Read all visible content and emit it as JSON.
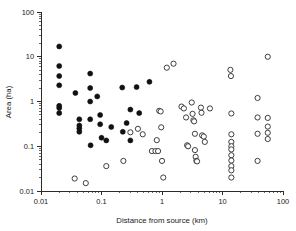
{
  "chart_data": {
    "type": "scatter",
    "title": "",
    "xlabel": "Distance from source (km)",
    "ylabel": "Area (ha)",
    "xscale": "log",
    "yscale": "log",
    "xlim": [
      0.01,
      100
    ],
    "ylim": [
      0.01,
      100
    ],
    "xticks": [
      "0.01",
      "0.1",
      "1",
      "10",
      "100"
    ],
    "xtick_values": [
      0.01,
      0.1,
      1,
      10,
      100
    ],
    "yticks": [
      "0.01",
      "0.1",
      "1",
      "10",
      "100"
    ],
    "ytick_values": [
      0.01,
      0.1,
      1,
      10,
      100
    ],
    "grid": false,
    "legend": null,
    "series": [
      {
        "name": "filled-circles",
        "marker": "filled circle",
        "color": "#111111",
        "points": [
          [
            0.02,
            17.0
          ],
          [
            0.02,
            6.2
          ],
          [
            0.02,
            3.7
          ],
          [
            0.02,
            2.3
          ],
          [
            0.02,
            0.8
          ],
          [
            0.02,
            0.72
          ],
          [
            0.02,
            0.55
          ],
          [
            0.037,
            1.55
          ],
          [
            0.043,
            0.4
          ],
          [
            0.043,
            0.29
          ],
          [
            0.043,
            0.25
          ],
          [
            0.043,
            0.21
          ],
          [
            0.065,
            4.2
          ],
          [
            0.065,
            2.0
          ],
          [
            0.065,
            1.0
          ],
          [
            0.065,
            0.4
          ],
          [
            0.066,
            0.105
          ],
          [
            0.085,
            1.3
          ],
          [
            0.095,
            0.5
          ],
          [
            0.095,
            0.31
          ],
          [
            0.1,
            0.155
          ],
          [
            0.12,
            0.135
          ],
          [
            0.145,
            0.27
          ],
          [
            0.22,
            2.05
          ],
          [
            0.225,
            0.21
          ],
          [
            0.26,
            0.33
          ],
          [
            0.3,
            0.66
          ],
          [
            0.3,
            0.135
          ],
          [
            0.38,
            2.1
          ],
          [
            0.42,
            0.55
          ],
          [
            0.62,
            2.75
          ]
        ]
      },
      {
        "name": "open-circles",
        "marker": "open circle",
        "color": "#2a2a2a",
        "points": [
          [
            0.036,
            0.019
          ],
          [
            0.055,
            0.015
          ],
          [
            0.12,
            0.036
          ],
          [
            0.23,
            0.047
          ],
          [
            0.3,
            0.205
          ],
          [
            0.4,
            0.245
          ],
          [
            0.48,
            0.185
          ],
          [
            0.68,
            0.078
          ],
          [
            0.78,
            0.078
          ],
          [
            0.82,
            0.137
          ],
          [
            0.86,
            0.078
          ],
          [
            0.9,
            0.62
          ],
          [
            0.95,
            0.6
          ],
          [
            0.97,
            0.265
          ],
          [
            1.0,
            0.047
          ],
          [
            1.05,
            0.02
          ],
          [
            1.2,
            5.7
          ],
          [
            1.55,
            7.0
          ],
          [
            2.1,
            0.77
          ],
          [
            2.3,
            0.7
          ],
          [
            2.5,
            0.44
          ],
          [
            2.6,
            0.105
          ],
          [
            2.7,
            0.1
          ],
          [
            3.1,
            0.95
          ],
          [
            3.2,
            0.53
          ],
          [
            3.3,
            0.38
          ],
          [
            3.4,
            0.36
          ],
          [
            3.5,
            0.19
          ],
          [
            3.5,
            0.082
          ],
          [
            3.6,
            0.058
          ],
          [
            3.7,
            0.047
          ],
          [
            3.8,
            0.046
          ],
          [
            4.4,
            0.73
          ],
          [
            4.5,
            0.56
          ],
          [
            4.6,
            0.175
          ],
          [
            4.9,
            0.165
          ],
          [
            5.1,
            0.125
          ],
          [
            6.2,
            0.7
          ],
          [
            13.5,
            5.1
          ],
          [
            13.8,
            3.7
          ],
          [
            14.0,
            0.54
          ],
          [
            14.0,
            0.185
          ],
          [
            14.0,
            0.125
          ],
          [
            14.0,
            0.1
          ],
          [
            14.0,
            0.085
          ],
          [
            14.0,
            0.063
          ],
          [
            14.0,
            0.048
          ],
          [
            14.0,
            0.036
          ],
          [
            14.0,
            0.029
          ],
          [
            14.0,
            0.02
          ],
          [
            38.0,
            1.2
          ],
          [
            38.0,
            0.44
          ],
          [
            38.0,
            0.19
          ],
          [
            38.0,
            0.047
          ],
          [
            56.0,
            10.0
          ],
          [
            56.0,
            0.43
          ],
          [
            56.0,
            0.275
          ],
          [
            56.0,
            0.2
          ],
          [
            56.0,
            0.145
          ]
        ]
      }
    ]
  },
  "axes": {
    "x_title": "Distance from source (km)",
    "y_title": "Area (ha)"
  }
}
